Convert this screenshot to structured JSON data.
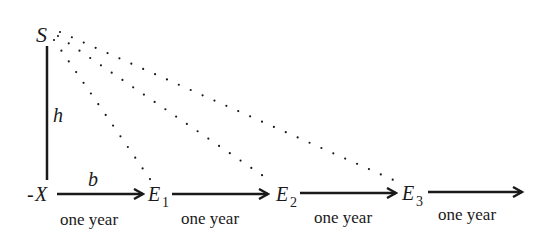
{
  "diagram": {
    "nodes": {
      "S": {
        "label": "S"
      },
      "h": {
        "label": "h"
      },
      "X": {
        "label": "X",
        "prefix": "-"
      },
      "b": {
        "label": "b"
      },
      "E1": {
        "label": "E",
        "sub": "1"
      },
      "E2": {
        "label": "E",
        "sub": "2"
      },
      "E3": {
        "label": "E",
        "sub": "3"
      }
    },
    "segments": [
      {
        "label": "one year"
      },
      {
        "label": "one year"
      },
      {
        "label": "one year"
      },
      {
        "label": "one year"
      }
    ],
    "colors": {
      "ink": "#1a1a1a",
      "background": "#ffffff"
    }
  }
}
